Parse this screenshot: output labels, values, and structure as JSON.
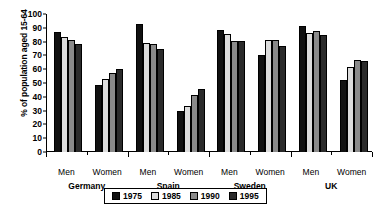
{
  "chart_data": {
    "type": "bar",
    "title": "",
    "xlabel": "",
    "ylabel": "% of population aged 15-64",
    "ylim": [
      0,
      100
    ],
    "ytick_step": 10,
    "yticks": [
      "0",
      "10",
      "20",
      "30",
      "40",
      "50",
      "60",
      "70",
      "80",
      "90",
      "100"
    ],
    "grid": false,
    "legend_position": "bottom-center",
    "series": [
      {
        "name": "1975",
        "color": "#111111"
      },
      {
        "name": "1985",
        "color": "#dcdcdc"
      },
      {
        "name": "1990",
        "color": "#8a8a8a"
      },
      {
        "name": "1995",
        "color": "#2b2b2b"
      }
    ],
    "groups": [
      {
        "country": "Germany",
        "subgroups": [
          {
            "label": "Men",
            "values": [
              87,
              83,
              81.5,
              78.5
            ]
          },
          {
            "label": "Women",
            "values": [
              48.5,
              53,
              57,
              60.5
            ]
          }
        ]
      },
      {
        "country": "Spain",
        "subgroups": [
          {
            "label": "Men",
            "values": [
              93,
              79,
              78,
              75
            ]
          },
          {
            "label": "Women",
            "values": [
              29.5,
              33,
              41,
              45.5
            ]
          }
        ]
      },
      {
        "country": "Sweden",
        "subgroups": [
          {
            "label": "Men",
            "values": [
              88.5,
              85.5,
              80.5,
              80.5
            ]
          },
          {
            "label": "Women",
            "values": [
              70,
              81,
              81,
              77
            ]
          }
        ]
      },
      {
        "country": "UK",
        "subgroups": [
          {
            "label": "Men",
            "values": [
              91.5,
              86.5,
              87.5,
              84.5
            ]
          },
          {
            "label": "Women",
            "values": [
              52,
              61.5,
              66.5,
              66
            ]
          }
        ]
      }
    ]
  }
}
